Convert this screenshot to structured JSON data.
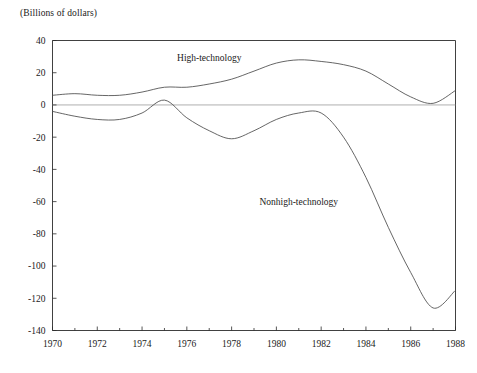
{
  "chart_data": {
    "type": "line",
    "title": "",
    "axis_note": "(Billions of dollars)",
    "xlabel": "",
    "ylabel": "",
    "xlim": [
      1970,
      1988
    ],
    "ylim": [
      -140,
      40
    ],
    "grid": false,
    "legend_position": "inline-annotations",
    "zero_line": true,
    "x_tick_labels": [
      "1970",
      "1972",
      "1974",
      "1976",
      "1978",
      "1980",
      "1982",
      "1984",
      "1986",
      "1988"
    ],
    "x_tick_values": [
      1970,
      1972,
      1974,
      1976,
      1978,
      1980,
      1982,
      1984,
      1986,
      1988
    ],
    "x_minor_tick_values": [
      1971,
      1973,
      1975,
      1977,
      1979,
      1981,
      1983,
      1985,
      1987
    ],
    "y_tick_labels": [
      "40",
      "20",
      "0",
      "-20",
      "-40",
      "-60",
      "-80",
      "-100",
      "-120",
      "-140"
    ],
    "y_tick_values": [
      40,
      20,
      0,
      -20,
      -40,
      -60,
      -80,
      -100,
      -120,
      -140
    ],
    "x": [
      1970,
      1971,
      1972,
      1973,
      1974,
      1975,
      1976,
      1977,
      1978,
      1979,
      1980,
      1981,
      1982,
      1983,
      1984,
      1985,
      1986,
      1987,
      1988
    ],
    "series": [
      {
        "name": "High-technology",
        "label": "High-technology",
        "color": "#4a4a4a",
        "label_x": 1977,
        "label_y": 27,
        "values": [
          6,
          7,
          6,
          6,
          8,
          11,
          11,
          13,
          16,
          21,
          26,
          28,
          27,
          25,
          21,
          13,
          5,
          1,
          9
        ]
      },
      {
        "name": "Nonhigh-technology",
        "label": "Nonhigh-technology",
        "color": "#4a4a4a",
        "label_x": 1981,
        "label_y": -62,
        "values": [
          -4,
          -7,
          -9,
          -9,
          -5,
          3,
          -8,
          -16,
          -21,
          -16,
          -9,
          -5,
          -5,
          -20,
          -45,
          -76,
          -104,
          -126,
          -115
        ]
      }
    ]
  }
}
